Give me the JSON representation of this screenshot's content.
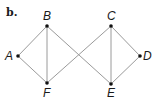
{
  "panel_label": "b.",
  "graph": {
    "vertices": [
      {
        "id": "A",
        "label": "A",
        "x": 18,
        "y": 56,
        "lx": 5,
        "ly": 60
      },
      {
        "id": "B",
        "label": "B",
        "x": 47,
        "y": 26,
        "lx": 43,
        "ly": 20
      },
      {
        "id": "F",
        "label": "F",
        "x": 47,
        "y": 83,
        "lx": 43,
        "ly": 97
      },
      {
        "id": "C",
        "label": "C",
        "x": 111,
        "y": 26,
        "lx": 107,
        "ly": 20
      },
      {
        "id": "E",
        "label": "E",
        "x": 111,
        "y": 84,
        "lx": 107,
        "ly": 97
      },
      {
        "id": "D",
        "label": "D",
        "x": 140,
        "y": 56,
        "lx": 143,
        "ly": 60
      }
    ],
    "edges": [
      [
        "A",
        "B"
      ],
      [
        "A",
        "F"
      ],
      [
        "B",
        "F"
      ],
      [
        "B",
        "E"
      ],
      [
        "F",
        "C"
      ],
      [
        "C",
        "E"
      ],
      [
        "C",
        "D"
      ],
      [
        "E",
        "D"
      ]
    ],
    "colors": {
      "edge": "#9a9a9a",
      "vertex": "#111111",
      "text": "#1a1a1a"
    }
  }
}
